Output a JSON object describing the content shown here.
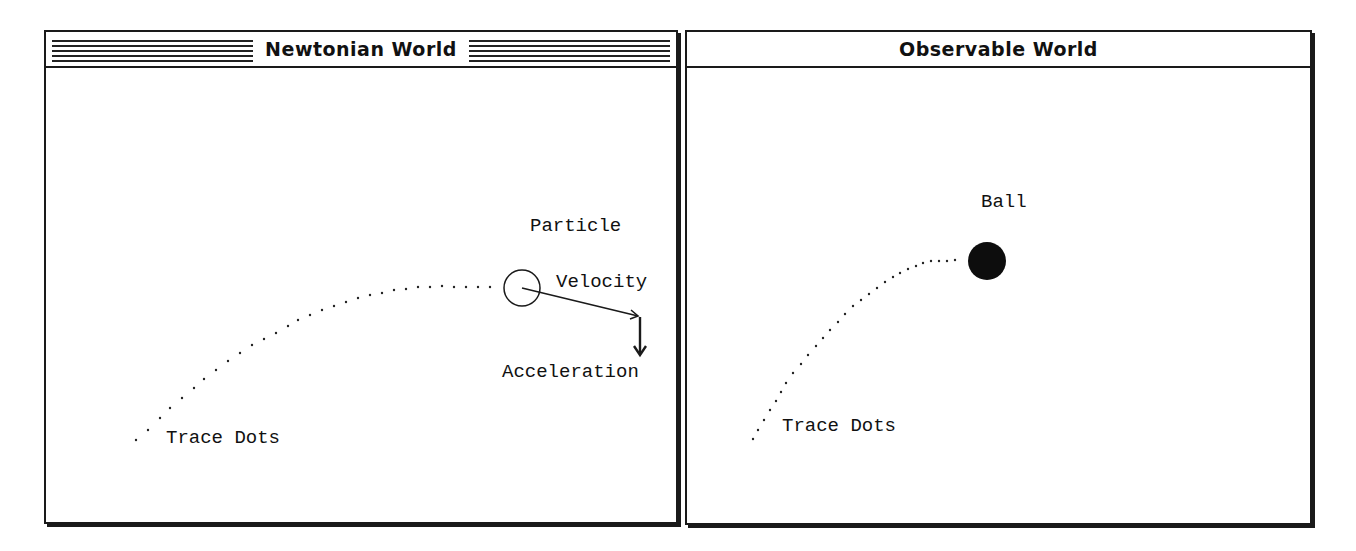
{
  "windows": {
    "newtonian": {
      "title": "Newtonian World",
      "active": true,
      "labels": {
        "particle": "Particle",
        "velocity": "Velocity",
        "acceleration": "Acceleration",
        "trace_dots": "Trace Dots"
      },
      "icons": {
        "particle": "hollow-circle",
        "velocity": "arrow-right-down",
        "acceleration": "arrow-down"
      }
    },
    "observable": {
      "title": "Observable World",
      "active": false,
      "labels": {
        "ball": "Ball",
        "trace_dots": "Trace Dots"
      },
      "icons": {
        "ball": "filled-circle"
      }
    }
  },
  "colors": {
    "ink": "#1a1a1a",
    "background": "#ffffff"
  }
}
